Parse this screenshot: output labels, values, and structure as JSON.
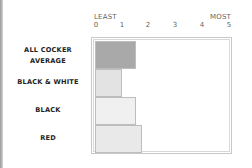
{
  "chart_data": {
    "type": "bar",
    "orientation": "horizontal",
    "title": "",
    "categories": [
      "ALL COCKER AVERAGE",
      "BLACK & WHITE",
      "BLACK",
      "RED"
    ],
    "values": [
      1.55,
      1.0,
      1.55,
      1.75
    ],
    "xlabel_min": "LEAST",
    "xlabel_max": "MOST",
    "xticks": [
      "0",
      "1",
      "2",
      "3",
      "4",
      "5"
    ],
    "xlim": [
      0,
      5
    ],
    "grid": false,
    "legend": null,
    "colors": [
      "#a9a9a9",
      "#e3e3e3",
      "#f0f0f0",
      "#e9e9e9"
    ]
  },
  "labels": {
    "least": "LEAST",
    "most": "MOST",
    "cat0_line1": "ALL COCKER",
    "cat0_line2": "AVERAGE",
    "cat1": "BLACK & WHITE",
    "cat2": "BLACK",
    "cat3": "RED"
  }
}
